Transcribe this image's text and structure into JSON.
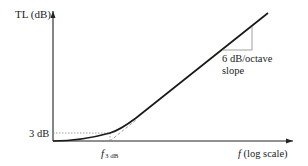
{
  "diagram": {
    "type": "transmission-loss-vs-frequency",
    "y_axis": {
      "label": "TL (dB)"
    },
    "x_axis": {
      "label_italic": "f",
      "label_rest": " (log scale)"
    },
    "markers": {
      "level_label": "3 dB",
      "freq_label_main": "f",
      "freq_label_sub": "3 dB"
    },
    "slope_annotation": {
      "line1": "6 dB/octave",
      "line2": "slope"
    },
    "colors": {
      "curve": "#1a1a1a",
      "axis": "#222222",
      "guide": "#888888"
    }
  }
}
